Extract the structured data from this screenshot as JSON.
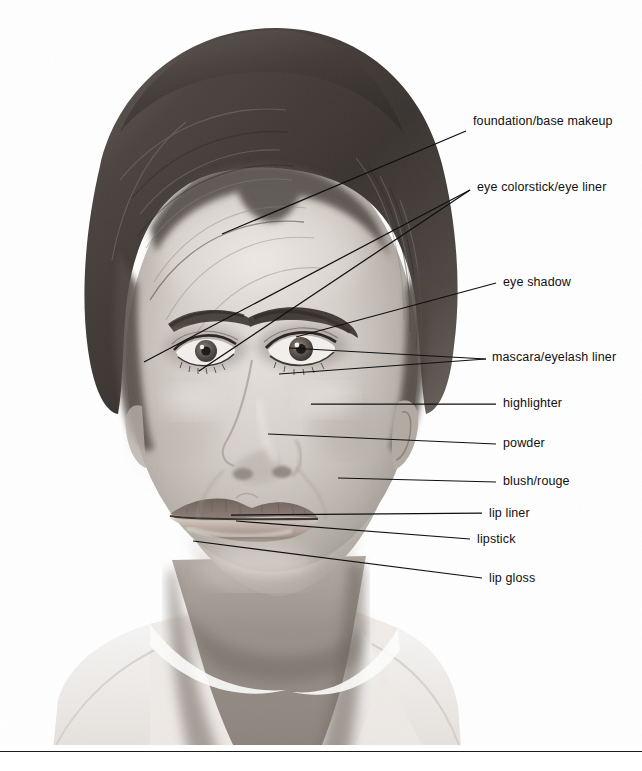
{
  "figure": {
    "image_type": "black-and-white photograph with leader-line callouts",
    "background_color": "#ffffff",
    "line_color": "#101010",
    "text_color": "#101010"
  },
  "callouts": [
    {
      "id": "foundation",
      "label": "foundation/base makeup",
      "text_x": 473,
      "text_y": 114,
      "line": {
        "x1": 222,
        "y1": 234,
        "x2": 466,
        "y2": 131
      }
    },
    {
      "id": "eye-colorstick",
      "label": "eye colorstick/eye liner",
      "text_x": 477,
      "text_y": 180,
      "line": {
        "x1": 144,
        "y1": 362,
        "x2": 470,
        "y2": 190
      },
      "line2": {
        "x1": 199,
        "y1": 371,
        "x2": 470,
        "y2": 190
      }
    },
    {
      "id": "eye-shadow",
      "label": "eye shadow",
      "text_x": 503,
      "text_y": 275,
      "line": {
        "x1": 296,
        "y1": 337,
        "x2": 496,
        "y2": 283
      }
    },
    {
      "id": "mascara",
      "label": "mascara/eyelash liner",
      "text_x": 492,
      "text_y": 350,
      "line": {
        "x1": 289,
        "y1": 348,
        "x2": 486,
        "y2": 359
      },
      "line2": {
        "x1": 279,
        "y1": 374,
        "x2": 486,
        "y2": 359
      }
    },
    {
      "id": "highlighter",
      "label": "highlighter",
      "text_x": 503,
      "text_y": 396,
      "line": {
        "x1": 311,
        "y1": 404,
        "x2": 496,
        "y2": 404
      }
    },
    {
      "id": "powder",
      "label": "powder",
      "text_x": 503,
      "text_y": 436,
      "line": {
        "x1": 268,
        "y1": 434,
        "x2": 496,
        "y2": 444
      }
    },
    {
      "id": "blush",
      "label": "blush/rouge",
      "text_x": 503,
      "text_y": 474,
      "line": {
        "x1": 338,
        "y1": 478,
        "x2": 496,
        "y2": 482
      }
    },
    {
      "id": "lip-liner",
      "label": "lip liner",
      "text_x": 489,
      "text_y": 506,
      "line": {
        "x1": 231,
        "y1": 515,
        "x2": 482,
        "y2": 513
      }
    },
    {
      "id": "lipstick",
      "label": "lipstick",
      "text_x": 477,
      "text_y": 532,
      "line": {
        "x1": 236,
        "y1": 521,
        "x2": 470,
        "y2": 539
      }
    },
    {
      "id": "lip-gloss",
      "label": "lip gloss",
      "text_x": 489,
      "text_y": 571,
      "line": {
        "x1": 193,
        "y1": 541,
        "x2": 482,
        "y2": 578
      }
    }
  ],
  "rule": {
    "y": 751,
    "color": "#1b1b1b"
  }
}
